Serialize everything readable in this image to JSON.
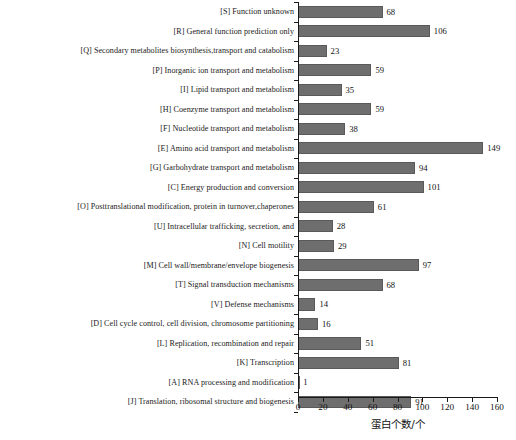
{
  "chart_data": {
    "type": "bar",
    "orientation": "horizontal",
    "title": "",
    "xlabel": "蛋白个数/个",
    "ylabel": "",
    "xlim": [
      0,
      160
    ],
    "xticks": [
      0,
      20,
      40,
      60,
      80,
      100,
      120,
      140,
      160
    ],
    "grid": false,
    "legend": false,
    "bar_color": "#6e6e6e",
    "axis_color": "#1a1a1a",
    "categories": [
      "[S] Function unknown",
      "[R] General function prediction only",
      "[Q] Secondary metabolites biosynthesis,transport and catabolism",
      "[P] Inorganic ion transport and metabolism",
      "[I] Lipid transport and metabolism",
      "[H] Coenzyme transport and metabolism",
      "[F] Nucleotide transport and metabolism",
      "[E] Amino acid transport and metabolism",
      "[G] Garbohydrate transport and metabolism",
      "[C] Energy production and conversion",
      "[O] Posttranslational modification, protein in turnover,chaperones",
      "[U] Intracellular trafficking, secretion, and",
      "[N] Cell motility",
      "[M] Cell wall/membrane/envelope biogenesis",
      "[T] Signal transduction mechanisms",
      "[V] Defense mechanisms",
      "[D] Cell cycle control, cell division, chromosome partitioning",
      "[L] Replication, recombination and repair",
      "[K] Transcription",
      "[A] RNA processing and modification",
      "[J] Translation, ribosomal structure and biogenesis"
    ],
    "values": [
      68,
      106,
      23,
      59,
      35,
      59,
      38,
      149,
      94,
      101,
      61,
      28,
      29,
      97,
      68,
      14,
      16,
      51,
      81,
      1,
      91
    ]
  }
}
